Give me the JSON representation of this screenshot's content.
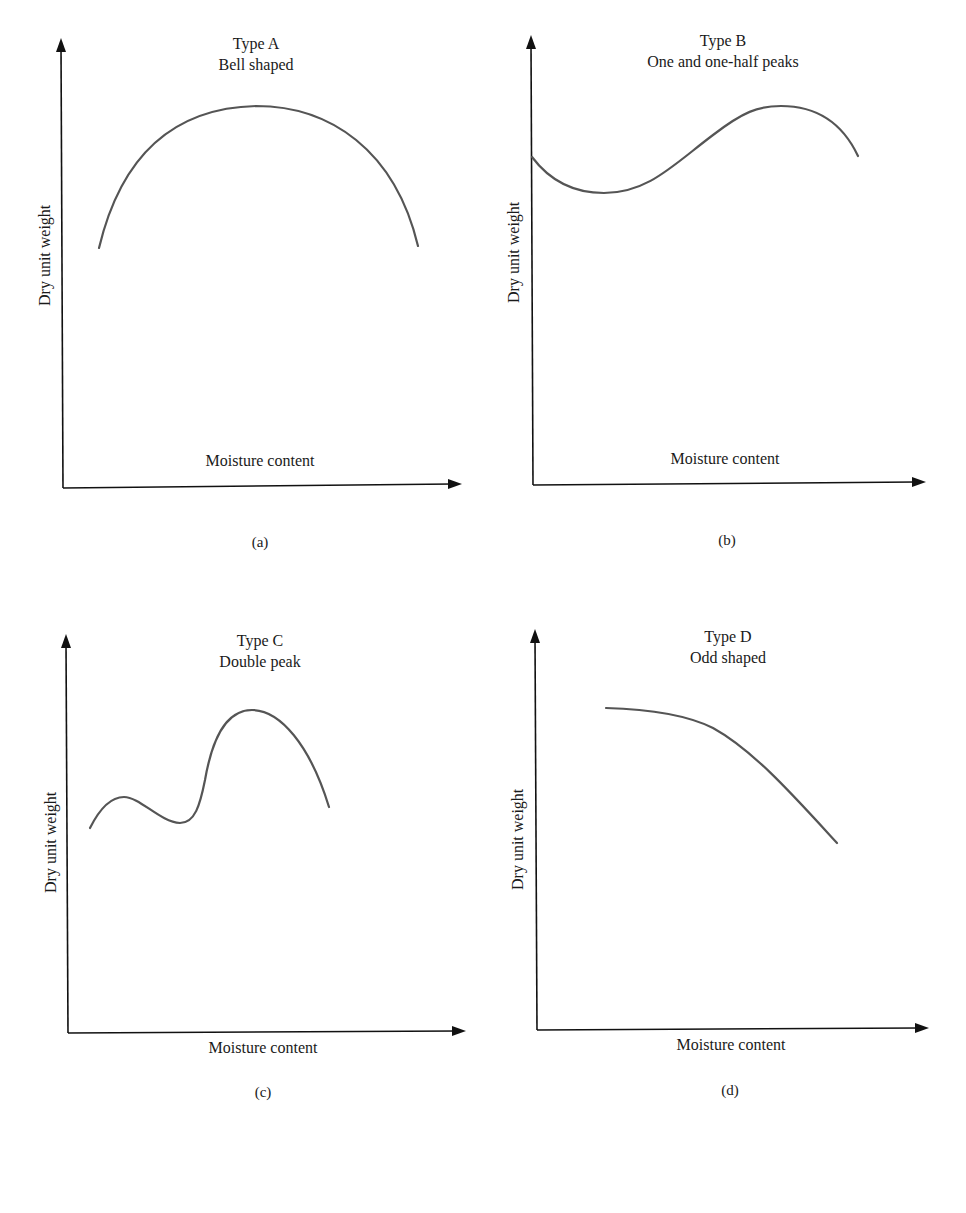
{
  "figure": {
    "panels": [
      {
        "id": "a",
        "type_label": "Type A",
        "shape_label": "Bell shaped",
        "xlabel": "Moisture content",
        "ylabel": "Dry unit weight",
        "caption": "(a)"
      },
      {
        "id": "b",
        "type_label": "Type B",
        "shape_label": "One and one-half peaks",
        "xlabel": "Moisture content",
        "ylabel": "Dry unit weight",
        "caption": "(b)"
      },
      {
        "id": "c",
        "type_label": "Type C",
        "shape_label": "Double peak",
        "xlabel": "Moisture content",
        "ylabel": "Dry unit weight",
        "caption": "(c)"
      },
      {
        "id": "d",
        "type_label": "Type D",
        "shape_label": "Odd shaped",
        "xlabel": "Moisture content",
        "ylabel": "Dry unit weight",
        "caption": "(d)"
      }
    ],
    "colors": {
      "axis": "#111111",
      "curve": "#555555",
      "text": "#1a1a1a"
    }
  }
}
